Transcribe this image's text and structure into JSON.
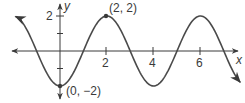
{
  "chart_data": {
    "type": "line",
    "title": "",
    "xlabel": "x",
    "ylabel": "y",
    "function": "y = -2cos(πx/2)",
    "x_ticks": [
      2,
      4,
      6
    ],
    "x_tick_labels": [
      "2",
      "4",
      "6"
    ],
    "y_ticks": [
      -2,
      -1,
      1,
      2
    ],
    "y_tick_labels": [
      "2"
    ],
    "xlim": [
      -2.5,
      7.9
    ],
    "ylim": [
      -2.5,
      2.6
    ],
    "grid": false,
    "series": [
      {
        "name": "curve",
        "x": [
          -1.9,
          -1,
          0,
          1,
          2,
          3,
          4,
          5,
          6,
          7,
          7.7
        ],
        "y": [
          1.98,
          0,
          -2,
          0,
          2,
          0,
          -2,
          0,
          2,
          0,
          -1.78
        ]
      }
    ],
    "annotations": [
      {
        "point": [
          2,
          2
        ],
        "label": "(2, 2)"
      },
      {
        "point": [
          0,
          -2
        ],
        "label": "(0, −2)"
      }
    ],
    "colors": {
      "curve": "#4a4a4a",
      "axes": "#3a3a3a",
      "points": "#3a3a3a"
    }
  },
  "labels": {
    "x_axis": "x",
    "y_axis": "y",
    "tick_x_2": "2",
    "tick_x_4": "4",
    "tick_x_6": "6",
    "tick_y_2": "2",
    "point_max": "(2, 2)",
    "point_min": "(0, −2)"
  }
}
